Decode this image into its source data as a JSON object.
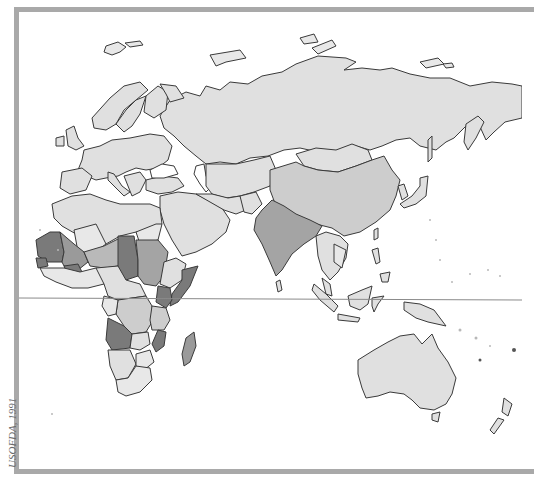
{
  "map": {
    "credit": "USOFDA, 1991",
    "region": "Eastern Hemisphere (Europe, Africa, Asia, Oceania)",
    "features": {
      "equator_line": true
    },
    "legend_shades": {
      "lightest": "#e8e8e8",
      "light": "#dcdcdc",
      "medium": "#b9b9b9",
      "medium_dark": "#9a9a9a",
      "dark": "#7a7a7a"
    },
    "frame_color": "#a9a9a9",
    "highlighted_dark_regions": [
      "Mauritania",
      "Mali-Niger region",
      "Chad",
      "Somalia",
      "Kenya",
      "Angola",
      "Mozambique",
      "Madagascar"
    ],
    "highlighted_medium_regions": [
      "Sudan",
      "India",
      "China",
      "Niger",
      "Ethiopia",
      "Tanzania"
    ]
  }
}
